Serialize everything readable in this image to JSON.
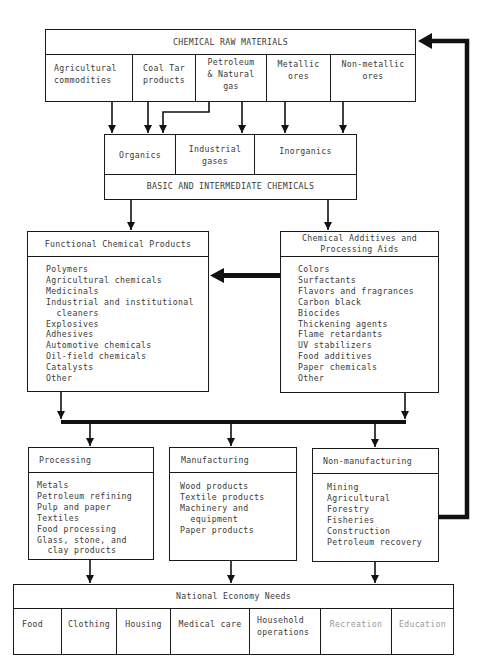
{
  "raw_materials": {
    "title": "CHEMICAL RAW MATERIALS",
    "items": [
      "Agricultural\ncommodities",
      "Coal Tar\nproducts",
      "Petroleum\n& Natural\ngas",
      "Metallic\nores",
      "Non-metallic\nores"
    ]
  },
  "basic_chemicals": {
    "title": "BASIC AND INTERMEDIATE CHEMICALS",
    "items": [
      "Organics",
      "Industrial\ngases",
      "Inorganics"
    ]
  },
  "functional_products": {
    "title": "Functional Chemical Products",
    "items": "Polymers\nAgricultural chemicals\nMedicinals\nIndustrial and institutional\n  cleaners\nExplosives\nAdhesives\nAutomotive chemicals\nOil-field chemicals\nCatalysts\nOther"
  },
  "additives": {
    "title": "Chemical Additives and\nProcessing Aids",
    "items": "Colors\nSurfactants\nFlavors and fragrances\nCarbon black\nBiocides\nThickening agents\nFlame retardants\nUV stabilizers\nFood additives\nPaper chemicals\nOther"
  },
  "processing": {
    "title": "Processing",
    "items": "Metals\nPetroleum refining\nPulp and paper\nTextiles\nFood processing\nGlass, stone, and\n  clay products"
  },
  "manufacturing": {
    "title": "Manufacturing",
    "items": "Wood products\nTextile products\nMachinery and\n  equipment\nPaper products"
  },
  "non_manufacturing": {
    "title": "Non-manufacturing",
    "items": "Mining\nAgricultural\nForestry\nFisheries\nConstruction\nPetroleum recovery"
  },
  "national_needs": {
    "title": "National Economy Needs",
    "items": [
      "Food",
      "Clothing",
      "Housing",
      "Medical care",
      "Household\noperations",
      "Recreation",
      "Education"
    ]
  }
}
